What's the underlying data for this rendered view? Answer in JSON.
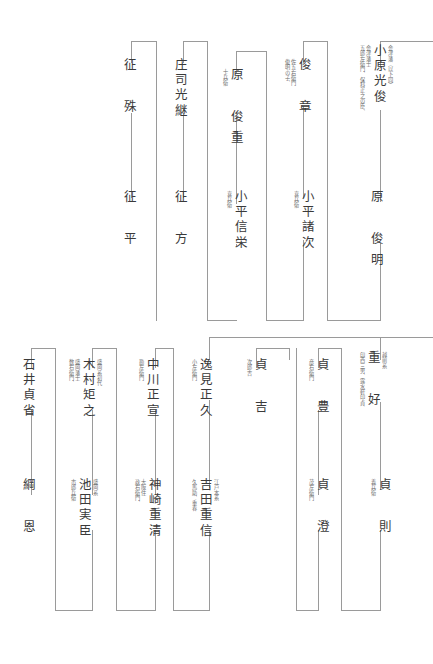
{
  "doc": {
    "type": "genealogy-chart",
    "orientation": "vertical-japanese",
    "line_color": "#9a9a9a",
    "text_color": "#3a3a3a",
    "note_color": "#6d6d6d"
  },
  "top_section": {
    "nodes": [
      {
        "id": "t1",
        "name": "小原光俊",
        "note_right": "会津藩（以下同）",
        "note_left": "五郎左衛門、保科正之の臣、",
        "note_left2": "会津藩士"
      },
      {
        "id": "t2",
        "name": "原　俊明",
        "note_right": "",
        "note_left": ""
      },
      {
        "id": "t3",
        "name": "俊　章",
        "note_left": "俊明の子、",
        "note_left2": "佐五右衛門"
      },
      {
        "id": "t4",
        "name": "小平諸次",
        "note_left": "喜兵衛"
      },
      {
        "id": "t5",
        "name": "原　俊重",
        "note_left": "十兵衛"
      },
      {
        "id": "t6",
        "name": "小平信栄",
        "note_left": "喜兵衛"
      },
      {
        "id": "t7",
        "name": "庄司光継",
        "note_left": ""
      },
      {
        "id": "t8",
        "name": "征　方",
        "note_left": ""
      },
      {
        "id": "t9",
        "name": "征　殊",
        "note_left": ""
      },
      {
        "id": "t10",
        "name": "征　平",
        "note_left": ""
      }
    ]
  },
  "bottom_section": {
    "nodes": [
      {
        "id": "b1",
        "name": "重　好",
        "note_right": "越前系",
        "note_left": "印西三男、露水軒印貞"
      },
      {
        "id": "b2",
        "name": "貞　則",
        "note_left": "義兵衛"
      },
      {
        "id": "b3",
        "name": "貞　豊",
        "note_left": "彦右衛門"
      },
      {
        "id": "b4",
        "name": "貞　澄",
        "note_left": "茂左衛門"
      },
      {
        "id": "b5",
        "name": "貞　吉",
        "note_left": "次郎吉"
      },
      {
        "id": "b6",
        "name": "逸見正久",
        "note_left": "小左衛門"
      },
      {
        "id": "b7",
        "name": "吉田重信",
        "note_right": "江戸本系",
        "note_left": "久馬助、重春"
      },
      {
        "id": "b8",
        "name": "中川正宣",
        "note_left": "勘左衛門"
      },
      {
        "id": "b9",
        "name": "神崎重清",
        "note_left": "政右衛門、",
        "note_left2": "大阪住"
      },
      {
        "id": "b10",
        "name": "木村矩之",
        "note_right": "盛岡系初代",
        "note_left": "数右衛門、",
        "note_left2": "盛岡藩士"
      },
      {
        "id": "b11",
        "name": "池田実臣",
        "note_right": "盛岡系",
        "note_left": "市郎兵衛"
      },
      {
        "id": "b12",
        "name": "石井貞省",
        "note_left": ""
      },
      {
        "id": "b13",
        "name": "綱　恩",
        "note_left": ""
      }
    ]
  }
}
